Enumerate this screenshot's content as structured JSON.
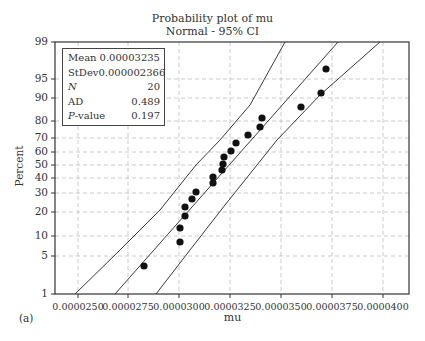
{
  "chart_data": {
    "type": "scatter",
    "title": "Probability plot of mu",
    "subtitle": "Normal - 95% CI",
    "xlabel": "mu",
    "ylabel": "Percent",
    "panel_label": "(a)",
    "xlim": [
      2.44e-05,
      4.13e-05
    ],
    "x_ticks": [
      "0.0000250",
      "0.0000275",
      "0.0000300",
      "0.0000325",
      "0.0000350",
      "0.0000375",
      "0.0000400"
    ],
    "y_scale": "normal-probability",
    "y_ticks": [
      "1",
      "5",
      "10",
      "20",
      "30",
      "40",
      "50",
      "60",
      "70",
      "80",
      "90",
      "95",
      "99"
    ],
    "grid": true,
    "legend": {
      "position": "upper-left",
      "rows": [
        {
          "key": "Mean",
          "value": "0.00003235",
          "italic": false
        },
        {
          "key": "StDev",
          "value": "0.000002366",
          "italic": false
        },
        {
          "key": "N",
          "value": "20",
          "italic": true
        },
        {
          "key": "AD",
          "value": "0.489",
          "italic": false
        },
        {
          "key": "P-value",
          "value": "0.197",
          "italic": true
        }
      ]
    },
    "series": [
      {
        "name": "mu observations",
        "points": [
          {
            "x": 2.82e-05,
            "pct": 3.4
          },
          {
            "x": 3e-05,
            "pct": 8.3
          },
          {
            "x": 3e-05,
            "pct": 13.2
          },
          {
            "x": 3.03e-05,
            "pct": 18.1
          },
          {
            "x": 3.03e-05,
            "pct": 23.0
          },
          {
            "x": 3.06e-05,
            "pct": 27.9
          },
          {
            "x": 3.09e-05,
            "pct": 32.8
          },
          {
            "x": 3.17e-05,
            "pct": 37.7
          },
          {
            "x": 3.17e-05,
            "pct": 42.6
          },
          {
            "x": 3.21e-05,
            "pct": 47.5
          },
          {
            "x": 3.22e-05,
            "pct": 52.5
          },
          {
            "x": 3.22e-05,
            "pct": 57.4
          },
          {
            "x": 3.26e-05,
            "pct": 62.3
          },
          {
            "x": 3.28e-05,
            "pct": 67.2
          },
          {
            "x": 3.34e-05,
            "pct": 72.1
          },
          {
            "x": 3.4e-05,
            "pct": 77.0
          },
          {
            "x": 3.41e-05,
            "pct": 81.9
          },
          {
            "x": 3.6e-05,
            "pct": 86.8
          },
          {
            "x": 3.7e-05,
            "pct": 91.7
          },
          {
            "x": 3.72e-05,
            "pct": 96.6
          }
        ]
      },
      {
        "name": "Fitted normal line",
        "type": "line"
      },
      {
        "name": "Lower 95% CI",
        "type": "line"
      },
      {
        "name": "Upper 95% CI",
        "type": "line"
      }
    ]
  },
  "plot": {
    "frame": {
      "left": 55,
      "top": 42,
      "right": 409,
      "bottom": 294
    },
    "x_tick_px": [
      78,
      128,
      179,
      230,
      281,
      332,
      383
    ],
    "y_tick_px": {
      "1": 294,
      "5": 256,
      "10": 236,
      "20": 212,
      "30": 193,
      "40": 178,
      "50": 165,
      "60": 152,
      "70": 138,
      "80": 121,
      "90": 98,
      "95": 79,
      "99": 42
    },
    "points_px": [
      [
        144,
        266
      ],
      [
        180,
        242
      ],
      [
        180,
        228
      ],
      [
        185,
        216
      ],
      [
        185,
        207
      ],
      [
        192,
        199
      ],
      [
        196,
        192
      ],
      [
        213,
        183
      ],
      [
        213,
        177
      ],
      [
        222,
        170
      ],
      [
        223,
        164
      ],
      [
        224,
        157
      ],
      [
        231,
        151
      ],
      [
        236,
        143
      ],
      [
        248,
        135
      ],
      [
        260,
        127
      ],
      [
        262,
        118
      ],
      [
        301,
        107
      ],
      [
        321,
        93
      ],
      [
        326,
        69
      ]
    ],
    "fit_line_px": [
      [
        115,
        294
      ],
      [
        338,
        42
      ]
    ],
    "ci_left_px": [
      [
        75,
        294
      ],
      [
        120,
        250
      ],
      [
        160,
        210
      ],
      [
        196,
        165
      ],
      [
        220,
        140
      ],
      [
        250,
        105
      ],
      [
        285,
        42
      ]
    ],
    "ci_right_px": [
      [
        156,
        294
      ],
      [
        190,
        250
      ],
      [
        225,
        205
      ],
      [
        257,
        165
      ],
      [
        277,
        140
      ],
      [
        320,
        95
      ],
      [
        380,
        42
      ]
    ],
    "colors": {
      "frame": "#333333",
      "grid": "#bdbdbd",
      "points": "#111111",
      "lines": "#222222"
    }
  }
}
